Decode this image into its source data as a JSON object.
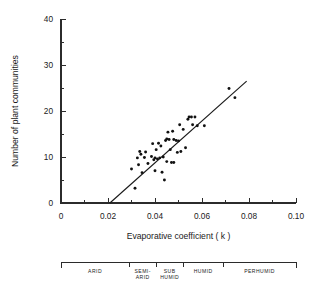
{
  "chart_data": {
    "type": "scatter",
    "title": "",
    "xlabel": "Evaporative coefficient ( k )",
    "ylabel": "Number of plant communities",
    "xlim": [
      0,
      0.1
    ],
    "ylim": [
      0,
      40
    ],
    "grid": false,
    "legend_position": "none",
    "x_ticks": [
      0,
      0.02,
      0.04,
      0.06,
      0.08,
      0.1
    ],
    "x_tick_labels": [
      "0",
      "0.02",
      "0.04",
      "0.06",
      "0.08",
      "0.10"
    ],
    "x_minor_ticks": [
      0.01,
      0.03,
      0.05,
      0.07,
      0.09
    ],
    "y_ticks": [
      0,
      10,
      20,
      30,
      40
    ],
    "y_tick_labels": [
      "0",
      "10",
      "20",
      "30",
      "40"
    ],
    "y_minor_ticks": [
      5,
      15,
      25,
      35
    ],
    "marker": "filled-circle",
    "marker_color": "#111111",
    "points": [
      [
        0.03,
        7.4
      ],
      [
        0.0315,
        3.2
      ],
      [
        0.0325,
        9.8
      ],
      [
        0.033,
        8.3
      ],
      [
        0.0335,
        11.2
      ],
      [
        0.034,
        10.6
      ],
      [
        0.0345,
        6.6
      ],
      [
        0.0355,
        9.9
      ],
      [
        0.036,
        11.1
      ],
      [
        0.037,
        8.6
      ],
      [
        0.0385,
        10.1
      ],
      [
        0.039,
        12.9
      ],
      [
        0.0395,
        9.4
      ],
      [
        0.04,
        9.8
      ],
      [
        0.04,
        7.0
      ],
      [
        0.0405,
        11.6
      ],
      [
        0.041,
        9.6
      ],
      [
        0.0415,
        13.0
      ],
      [
        0.042,
        9.8
      ],
      [
        0.0425,
        12.4
      ],
      [
        0.043,
        6.7
      ],
      [
        0.0435,
        10.0
      ],
      [
        0.044,
        5.0
      ],
      [
        0.0445,
        13.6
      ],
      [
        0.045,
        13.9
      ],
      [
        0.045,
        9.0
      ],
      [
        0.0455,
        15.4
      ],
      [
        0.046,
        13.8
      ],
      [
        0.0465,
        11.6
      ],
      [
        0.047,
        8.8
      ],
      [
        0.0475,
        15.6
      ],
      [
        0.048,
        13.8
      ],
      [
        0.048,
        8.8
      ],
      [
        0.049,
        13.6
      ],
      [
        0.0495,
        11.0
      ],
      [
        0.05,
        13.5
      ],
      [
        0.0505,
        17.0
      ],
      [
        0.051,
        11.2
      ],
      [
        0.052,
        16.0
      ],
      [
        0.053,
        12.0
      ],
      [
        0.054,
        18.2
      ],
      [
        0.0545,
        18.7
      ],
      [
        0.0555,
        18.7
      ],
      [
        0.056,
        17.0
      ],
      [
        0.057,
        18.7
      ],
      [
        0.058,
        16.8
      ],
      [
        0.061,
        16.8
      ],
      [
        0.0715,
        24.9
      ],
      [
        0.074,
        22.9
      ]
    ],
    "fit_line": {
      "x_start": 0.0208,
      "y_start": 0.0,
      "x_end": 0.079,
      "y_end": 26.5,
      "style": "solid"
    },
    "climate_zones": {
      "bar_start": 0.0,
      "bar_end": 0.1,
      "zones": [
        {
          "label": "ARID",
          "label_lines": [
            "ARID"
          ],
          "start": 0.0,
          "end": 0.029
        },
        {
          "label": "SEMI-ARID",
          "label_lines": [
            "SEMI-",
            "ARID"
          ],
          "start": 0.029,
          "end": 0.0405
        },
        {
          "label": "SUB HUMID",
          "label_lines": [
            "SUB",
            "HUMID"
          ],
          "start": 0.0405,
          "end": 0.052
        },
        {
          "label": "HUMID",
          "label_lines": [
            "HUMID"
          ],
          "start": 0.052,
          "end": 0.069
        },
        {
          "label": "PERHUMID",
          "label_lines": [
            "PERHUMID"
          ],
          "start": 0.069,
          "end": 0.1
        }
      ]
    }
  }
}
